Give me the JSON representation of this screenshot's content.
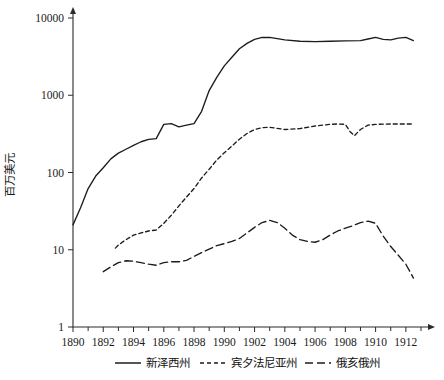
{
  "chart_data": {
    "type": "line",
    "title": "",
    "subtitle": "",
    "xlabel": "",
    "ylabel": "百万美元",
    "xlim": [
      1890,
      1913
    ],
    "ylim": [
      1,
      10000
    ],
    "yscale": "log",
    "grid": false,
    "legend_position": "bottom",
    "x_tick_labels": [
      "1890",
      "1892",
      "1894",
      "1896",
      "1898",
      "1990",
      "1902",
      "1904",
      "1906",
      "1908",
      "1910",
      "1912"
    ],
    "x_tick_values": [
      1890,
      1892,
      1894,
      1896,
      1898,
      1900,
      1902,
      1904,
      1906,
      1908,
      1910,
      1912
    ],
    "y_tick_labels": [
      "10000",
      "1000",
      "100",
      "10",
      "1"
    ],
    "y_tick_values": [
      10000,
      1000,
      100,
      10,
      1
    ],
    "series": [
      {
        "name": "新泽西州",
        "style": "solid",
        "color": "#1c1c1c",
        "x": [
          1890,
          1890.5,
          1891,
          1891.5,
          1892,
          1892.5,
          1893,
          1893.5,
          1894,
          1894.5,
          1895,
          1895.5,
          1896,
          1896.5,
          1897,
          1897.5,
          1898,
          1898.5,
          1899,
          1899.5,
          1900,
          1900.5,
          1901,
          1901.5,
          1902,
          1902.5,
          1903,
          1904,
          1905,
          1906,
          1907,
          1908,
          1909,
          1909.5,
          1910,
          1910.5,
          1911,
          1911.5,
          1912,
          1912.5
        ],
        "y": [
          21,
          35,
          62,
          90,
          115,
          150,
          178,
          200,
          225,
          250,
          268,
          275,
          420,
          430,
          390,
          410,
          430,
          620,
          1150,
          1700,
          2400,
          3100,
          4000,
          4700,
          5300,
          5600,
          5600,
          5200,
          5000,
          4950,
          5000,
          5050,
          5100,
          5350,
          5600,
          5300,
          5200,
          5500,
          5600,
          5100
        ]
      },
      {
        "name": "宾夕法尼亚州",
        "style": "dashed-short",
        "color": "#1c1c1c",
        "x": [
          1892.8,
          1893,
          1893.5,
          1894,
          1894.5,
          1895,
          1895.5,
          1896,
          1896.5,
          1897,
          1897.5,
          1898,
          1898.5,
          1899,
          1899.5,
          1900,
          1900.5,
          1901,
          1901.5,
          1902,
          1902.5,
          1903,
          1904,
          1905,
          1906,
          1907,
          1907.5,
          1908,
          1908.3,
          1908.6,
          1909,
          1909.5,
          1910,
          1911,
          1912,
          1912.5
        ],
        "y": [
          10.5,
          11.5,
          13.5,
          15.5,
          16.5,
          17.5,
          18,
          22,
          28,
          37,
          48,
          62,
          85,
          110,
          145,
          180,
          220,
          270,
          320,
          360,
          380,
          385,
          360,
          370,
          400,
          420,
          425,
          420,
          340,
          300,
          360,
          410,
          420,
          425,
          425,
          425
        ]
      },
      {
        "name": "俄亥俄州",
        "style": "dashed-long",
        "color": "#1c1c1c",
        "x": [
          1892,
          1892.5,
          1893,
          1893.5,
          1894,
          1894.5,
          1895,
          1895.5,
          1896,
          1896.5,
          1897,
          1897.5,
          1898,
          1898.5,
          1899,
          1899.5,
          1900,
          1900.5,
          1901,
          1901.5,
          1902,
          1902.5,
          1903,
          1903.5,
          1904,
          1904.5,
          1905,
          1905.5,
          1906,
          1906.5,
          1907,
          1907.5,
          1908,
          1908.5,
          1909,
          1909.5,
          1910,
          1910.5,
          1911,
          1911.5,
          1912,
          1912.5
        ],
        "y": [
          5.2,
          6.0,
          6.8,
          7.2,
          7.1,
          6.8,
          6.5,
          6.3,
          6.8,
          7.0,
          7.0,
          7.3,
          8.2,
          9.2,
          10.2,
          11.3,
          12.0,
          12.8,
          14.0,
          16.5,
          19.5,
          22.5,
          24.0,
          22.5,
          19.0,
          15.5,
          13.5,
          12.8,
          12.5,
          13.5,
          15.5,
          17.5,
          19.0,
          20.5,
          22.5,
          23.5,
          22.0,
          15.0,
          11.0,
          8.5,
          6.5,
          4.3
        ]
      }
    ]
  },
  "legend": {
    "items": [
      {
        "label": "新泽西州",
        "style": "solid"
      },
      {
        "label": "宾夕法尼亚州",
        "style": "dashed-short"
      },
      {
        "label": "俄亥俄州",
        "style": "dashed-long"
      }
    ]
  }
}
